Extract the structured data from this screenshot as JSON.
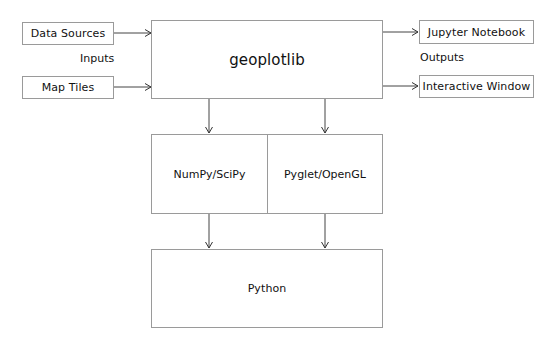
{
  "diagram": {
    "core": {
      "label": "geoplotlib"
    },
    "inputs": {
      "heading": "Inputs",
      "items": [
        {
          "label": "Data Sources"
        },
        {
          "label": "Map Tiles"
        }
      ]
    },
    "outputs": {
      "heading": "Outputs",
      "items": [
        {
          "label": "Jupyter Notebook"
        },
        {
          "label": "Interactive Window"
        }
      ]
    },
    "dependencies": {
      "items": [
        {
          "label": "NumPy/SciPy"
        },
        {
          "label": "Pyglet/OpenGL"
        }
      ]
    },
    "base": {
      "label": "Python"
    },
    "colors": {
      "border": "#9a9a9a",
      "arrow": "#333333",
      "text": "#111111",
      "background": "#ffffff"
    }
  }
}
